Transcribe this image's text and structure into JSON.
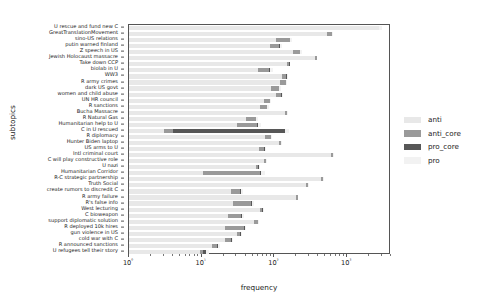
{
  "chart_data": {
    "type": "bar",
    "orientation": "horizontal",
    "stacked": true,
    "title": "",
    "xlabel": "frequency",
    "ylabel": "subtopics",
    "xscale": "log",
    "xlim": [
      1,
      4000
    ],
    "xticks": [
      1,
      10,
      100,
      1000
    ],
    "xtick_labels": [
      "10⁰",
      "10¹",
      "10²",
      "10³"
    ],
    "grid": false,
    "legend_position": "right",
    "legend": [
      "anti",
      "anti_core",
      "pro_core",
      "pro"
    ],
    "colors": {
      "anti": "#e8e8e8",
      "anti_core": "#9a9a9a",
      "pro_core": "#575757",
      "pro": "#f2f2f2"
    },
    "categories": [
      "U rescue and fund new C",
      "GreatTranslationMovement",
      "sino-US relations",
      "putin warned finland",
      "Z speech in US",
      "Jewish Holocaust massacre",
      "Take down CCP",
      "biolab in U",
      "WW3",
      "R army crimes",
      "dark US govt",
      "women and child abuse",
      "UN HR council",
      "R sanctions",
      "Bucha Massacre",
      "R Natural Gas",
      "Humanitarian help to U",
      "C in U rescued",
      "R diplomacy",
      "Hunter Biden laptop",
      "US arms to U",
      "Intl criminal court",
      "C will play constructive role",
      "U nazi",
      "Humanitarian Corridor",
      "R-C strategic partnership",
      "Truth Social",
      "create rumors to discredit C",
      "R army failure",
      "R's false info",
      "West lecturing",
      "C bioweapon",
      "support diplomatic solution",
      "R deployed 10k hires",
      "gun violence in US",
      "cold war with C",
      "R announced sanctions",
      "U refugees tell their story"
    ],
    "series": [
      {
        "name": "anti",
        "values": [
          2700,
          520,
          105,
          85,
          180,
          360,
          150,
          58,
          125,
          120,
          88,
          105,
          70,
          62,
          140,
          40,
          30,
          2.0,
          72,
          115,
          60,
          600,
          70,
          55,
          9.5,
          430,
          270,
          24,
          195,
          26,
          62,
          22,
          52,
          20,
          30,
          20,
          13,
          8.5
        ]
      },
      {
        "name": "anti_core",
        "values": [
          40,
          90,
          55,
          30,
          42,
          18,
          9,
          26,
          20,
          22,
          25,
          18,
          16,
          16,
          9,
          14,
          26,
          1.0,
          16,
          6,
          11,
          42,
          5,
          4,
          52,
          38,
          20,
          9,
          13,
          21,
          5,
          12,
          6,
          17,
          3,
          4,
          2,
          1
        ]
      },
      {
        "name": "pro_core",
        "values": [
          15,
          6,
          4,
          3,
          5,
          2,
          1,
          2,
          1,
          1,
          2,
          1,
          1,
          1,
          1,
          1,
          2,
          135,
          1,
          1,
          1,
          2,
          1,
          1,
          3,
          2,
          1,
          1,
          1,
          1,
          1,
          1,
          1,
          1,
          1,
          1,
          1,
          1
        ]
      },
      {
        "name": "pro",
        "values": [
          230,
          30,
          12,
          8,
          14,
          6,
          3,
          7,
          5,
          4,
          6,
          4,
          3,
          3,
          3,
          3,
          6,
          18,
          4,
          2,
          3,
          6,
          2,
          2,
          8,
          5,
          3,
          2,
          3,
          3,
          2,
          2,
          2,
          2,
          1,
          1,
          1,
          1
        ]
      }
    ]
  }
}
